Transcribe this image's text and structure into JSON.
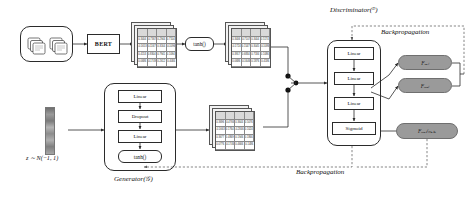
{
  "diagram": {
    "title_discriminator": "Discriminator(ᴰ)",
    "title_generator": "Generator(𝒢)",
    "backprop_top": "Backpropagation",
    "backprop_bottom": "Backpropagation",
    "noise_label": "z ∼ Ν(−1, 1)"
  },
  "input": {
    "icon_left": "documents-stack-icon",
    "icon_right": "documents-stack-icon"
  },
  "encoder": {
    "bert_label": "BERT",
    "tanh_label": "tanh()"
  },
  "generator": {
    "layers": [
      {
        "label": "Linear"
      },
      {
        "label": "Dropout"
      },
      {
        "label": "Linear"
      },
      {
        "label": "tanh()"
      }
    ]
  },
  "discriminator": {
    "layers": [
      {
        "label": "Linear"
      },
      {
        "label": "Linear"
      },
      {
        "label": "Linear"
      },
      {
        "label": "Sigmoid"
      }
    ],
    "outputs": [
      {
        "label": "Fₑₐₗ"
      },
      {
        "label": "Fᵣₑₐₗ"
      },
      {
        "label": "Fᵣₑₐₗ/ₘₐₖₑ"
      }
    ]
  },
  "matrices": {
    "bert_output": {
      "name": "bert-embedding-matrix",
      "rows": 4,
      "cols": 4,
      "sheets": 3,
      "values": [
        [
          "0.3404",
          "-0.7367",
          "0.2944",
          "0.7104"
        ],
        [
          "-0.1653",
          "0.1167",
          "0.3164",
          "-0.1096"
        ],
        [
          "0.4153",
          "0.8304",
          "0.7941",
          "0.1094"
        ],
        [
          "0.0686",
          "-0.1749",
          "0.2612",
          "0.4084"
        ]
      ]
    },
    "tanh_output": {
      "name": "tanh-activation-matrix",
      "rows": 4,
      "cols": 4,
      "sheets": 3,
      "values": [
        [
          "0.3406",
          "-0.7107",
          "0.3404",
          "0.5174"
        ],
        [
          "-0.1724",
          "0.1547",
          "0.3045",
          "-0.1086"
        ],
        [
          "0.3917",
          "0.6834",
          "0.7184",
          "0.1086"
        ],
        [
          "0.0686",
          "-0.1646",
          "0.1876",
          "0.4186"
        ]
      ]
    },
    "generator_output": {
      "name": "generated-fake-matrix",
      "rows": 4,
      "cols": 4,
      "sheets": 3,
      "values": [
        [
          "0.3696",
          "-0.4766",
          "0.3644",
          "0.5076"
        ],
        [
          "-0.1663",
          "0.1764",
          "-0.2846",
          "0.1024"
        ],
        [
          "0.3677",
          "0.4869",
          "0.1946",
          "0.1866"
        ],
        [
          "0.0776",
          "-0.1746",
          "0.4666",
          "0.1486"
        ]
      ]
    }
  },
  "colors": {
    "stroke": "#2b2b2b",
    "pill_fill": "#9a9a9a",
    "matrix_header": "#d9d9d9",
    "dashed": "#555555"
  }
}
